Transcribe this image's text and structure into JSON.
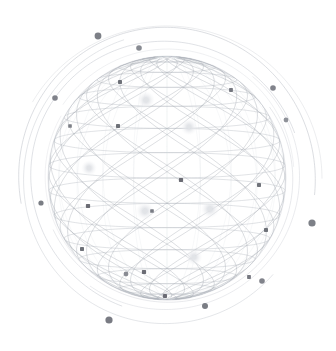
{
  "illustration": {
    "title": "Wireframe Globe Network",
    "alt_text": "Light grey wireframe sphere with latitude lines and two crossing families of diagonal geodesic lines, surrounded by thin concentric orbital arcs terminated with grey dots",
    "canvas": {
      "width": 336,
      "height": 351,
      "background": "#ffffff"
    },
    "palette": {
      "background": "#ffffff",
      "grid_line": "#b9bcc4",
      "grid_line_light": "#d3d6dc",
      "diagonal_line": "#a9adb6",
      "orbit_arc": "#c4c7ce",
      "orbit_arc_faint": "#dcdee3",
      "node_dark": "#5e6068",
      "node_mid": "#82858d",
      "node_glow_core": "#e2e4e8",
      "node_glow_halo": "#eff0f3"
    }
  },
  "globe": {
    "label": "wireframe-sphere",
    "center_x": 167,
    "center_y": 178,
    "radius_x": 119,
    "radius_y": 122,
    "tilt_degrees": -6,
    "latitude_count": 15,
    "longitude_count": 22,
    "diagonal_family_count": 2,
    "diagonal_lines_per_family": 13,
    "stroke_width": 0.55
  },
  "orbits": [
    {
      "name": "orbit-outer-1",
      "rx": 148,
      "ry": 151,
      "rotation": -18,
      "start_deg": 188,
      "sweep_deg": 196,
      "opacity": 0.85,
      "width": 0.7
    },
    {
      "name": "orbit-outer-2",
      "rx": 143,
      "ry": 146,
      "rotation": 22,
      "start_deg": 20,
      "sweep_deg": 210,
      "opacity": 0.7,
      "width": 0.65
    },
    {
      "name": "orbit-outer-3",
      "rx": 152,
      "ry": 155,
      "rotation": 95,
      "start_deg": 115,
      "sweep_deg": 150,
      "opacity": 0.55,
      "width": 0.6
    },
    {
      "name": "orbit-mid-1",
      "rx": 135,
      "ry": 138,
      "rotation": -40,
      "start_deg": 150,
      "sweep_deg": 230,
      "opacity": 0.8,
      "width": 0.65
    },
    {
      "name": "orbit-mid-2",
      "rx": 131,
      "ry": 133,
      "rotation": 60,
      "start_deg": 250,
      "sweep_deg": 175,
      "opacity": 0.6,
      "width": 0.6
    },
    {
      "name": "orbit-mid-3",
      "rx": 127,
      "ry": 129,
      "rotation": 10,
      "start_deg": 205,
      "sweep_deg": 140,
      "opacity": 0.5,
      "width": 0.55
    },
    {
      "name": "orbit-inner-1",
      "rx": 124,
      "ry": 126,
      "rotation": -70,
      "start_deg": 35,
      "sweep_deg": 190,
      "opacity": 0.65,
      "width": 0.6
    },
    {
      "name": "orbit-inner-2",
      "rx": 121,
      "ry": 123,
      "rotation": 140,
      "start_deg": 300,
      "sweep_deg": 130,
      "opacity": 0.45,
      "width": 0.55
    }
  ],
  "orbit_nodes": [
    {
      "name": "orbit-node-1",
      "x": 98,
      "y": 36,
      "r": 3.4,
      "color": "#6f727a"
    },
    {
      "name": "orbit-node-2",
      "x": 139,
      "y": 48,
      "r": 2.8,
      "color": "#7b7e86"
    },
    {
      "name": "orbit-node-3",
      "x": 55,
      "y": 98,
      "r": 2.8,
      "color": "#73767e"
    },
    {
      "name": "orbit-node-4",
      "x": 273,
      "y": 88,
      "r": 2.8,
      "color": "#73767e"
    },
    {
      "name": "orbit-node-5",
      "x": 286,
      "y": 120,
      "r": 2.4,
      "color": "#83868e"
    },
    {
      "name": "orbit-node-6",
      "x": 41,
      "y": 203,
      "r": 2.6,
      "color": "#6c6f77"
    },
    {
      "name": "orbit-node-7",
      "x": 312,
      "y": 223,
      "r": 3.6,
      "color": "#6f727a"
    },
    {
      "name": "orbit-node-8",
      "x": 262,
      "y": 281,
      "r": 2.8,
      "color": "#73767e"
    },
    {
      "name": "orbit-node-9",
      "x": 205,
      "y": 306,
      "r": 3.0,
      "color": "#6c6f77"
    },
    {
      "name": "orbit-node-10",
      "x": 109,
      "y": 320,
      "r": 3.6,
      "color": "#6a6d75"
    },
    {
      "name": "orbit-node-11",
      "x": 126,
      "y": 274,
      "r": 2.4,
      "color": "#7d8088"
    }
  ],
  "surface_nodes": [
    {
      "name": "surface-node-1",
      "x": 120,
      "y": 82,
      "r": 2.0,
      "color": "#62656d"
    },
    {
      "name": "surface-node-2",
      "x": 118,
      "y": 126,
      "r": 2.0,
      "color": "#62656d"
    },
    {
      "name": "surface-node-3",
      "x": 231,
      "y": 90,
      "r": 1.9,
      "color": "#6a6d75"
    },
    {
      "name": "surface-node-4",
      "x": 181,
      "y": 180,
      "r": 2.1,
      "color": "#5e6068"
    },
    {
      "name": "surface-node-5",
      "x": 88,
      "y": 206,
      "r": 2.1,
      "color": "#5e6068"
    },
    {
      "name": "surface-node-6",
      "x": 259,
      "y": 185,
      "r": 2.0,
      "color": "#64676f"
    },
    {
      "name": "surface-node-7",
      "x": 266,
      "y": 230,
      "r": 2.0,
      "color": "#64676f"
    },
    {
      "name": "surface-node-8",
      "x": 82,
      "y": 249,
      "r": 2.0,
      "color": "#62656d"
    },
    {
      "name": "surface-node-9",
      "x": 144,
      "y": 272,
      "r": 2.1,
      "color": "#5e6068"
    },
    {
      "name": "surface-node-10",
      "x": 165,
      "y": 296,
      "r": 2.0,
      "color": "#5e6068"
    },
    {
      "name": "surface-node-11",
      "x": 249,
      "y": 277,
      "r": 1.9,
      "color": "#6a6d75"
    },
    {
      "name": "surface-node-12",
      "x": 152,
      "y": 211,
      "r": 1.8,
      "color": "#6e7179"
    },
    {
      "name": "surface-node-13",
      "x": 70,
      "y": 126,
      "r": 1.8,
      "color": "#72757d"
    }
  ],
  "glow_nodes": [
    {
      "name": "glow-node-1",
      "x": 146,
      "y": 100,
      "r": 4.2
    },
    {
      "name": "glow-node-2",
      "x": 189,
      "y": 127,
      "r": 4.0
    },
    {
      "name": "glow-node-3",
      "x": 89,
      "y": 168,
      "r": 3.8
    },
    {
      "name": "glow-node-4",
      "x": 145,
      "y": 211,
      "r": 4.4
    },
    {
      "name": "glow-node-5",
      "x": 210,
      "y": 209,
      "r": 4.4
    },
    {
      "name": "glow-node-6",
      "x": 194,
      "y": 257,
      "r": 4.0
    }
  ]
}
